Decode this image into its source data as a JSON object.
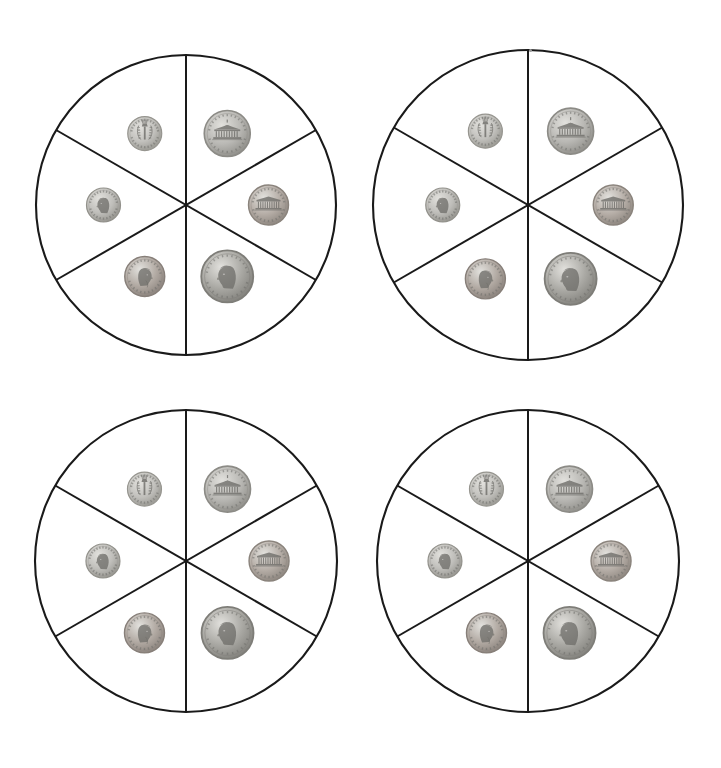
{
  "page": {
    "background_color": "#ffffff",
    "width": 721,
    "height": 768,
    "line_color": "#1a1a1a",
    "sector_count": 6
  },
  "coin_types": {
    "nickel_reverse": {
      "name": "nickel-reverse-monticello",
      "label": "Nickel (Monticello reverse)",
      "value_cents": 5,
      "diameter_px": 46,
      "metal_color": "#b9b8b4",
      "rim_color": "#8c8b86",
      "top_text": "UNITED STATES",
      "center_motif": "monticello-building",
      "mid_text": "MONTICELLO",
      "bottom_text": "FIVE CENTS"
    },
    "dime_reverse": {
      "name": "dime-reverse-torch",
      "label": "Dime (torch reverse)",
      "value_cents": 10,
      "diameter_px": 34,
      "metal_color": "#c2c1bd",
      "rim_color": "#96958f",
      "top_text": "UNITED STATES",
      "center_motif": "torch-olive-oak",
      "bottom_text": "ONE DIME"
    },
    "dime_obverse": {
      "name": "dime-obverse-roosevelt",
      "label": "Dime (Roosevelt obverse)",
      "value_cents": 10,
      "diameter_px": 34,
      "metal_color": "#bfbeba",
      "rim_color": "#92918b",
      "left_text": "LIBERTY",
      "center_motif": "roosevelt-profile",
      "bottom_text": "IN GOD WE TRUST"
    },
    "penny_reverse": {
      "name": "penny-reverse-lincoln-memorial",
      "label": "Penny (Lincoln Memorial reverse)",
      "value_cents": 1,
      "diameter_px": 40,
      "metal_color": "#b5ada6",
      "rim_color": "#8a837c",
      "top_text": "UNITED STATES",
      "center_motif": "lincoln-memorial",
      "bottom_text": "ONE CENT"
    },
    "penny_obverse": {
      "name": "penny-obverse-lincoln",
      "label": "Penny (Lincoln obverse)",
      "value_cents": 1,
      "diameter_px": 40,
      "metal_color": "#b2aaa3",
      "rim_color": "#877f79",
      "left_text": "LIBERTY",
      "center_motif": "lincoln-profile",
      "bottom_text": "IN GOD WE TRUST"
    },
    "nickel_obverse": {
      "name": "nickel-obverse-jefferson",
      "label": "Nickel (Jefferson obverse)",
      "value_cents": 5,
      "diameter_px": 52,
      "metal_color": "#a9a8a3",
      "rim_color": "#7e7d78",
      "left_text": "LIBERTY",
      "center_motif": "jefferson-profile",
      "bottom_text": "IN GOD WE TRUST"
    }
  },
  "spinners": [
    {
      "id": "spinner-1",
      "position_label": "top-left",
      "cx": 186,
      "cy": 205,
      "r": 150,
      "sectors": [
        {
          "index": 0,
          "angle_deg": -60,
          "coin": "nickel_reverse"
        },
        {
          "index": 1,
          "angle_deg": -120,
          "coin": "dime_reverse"
        },
        {
          "index": 2,
          "angle_deg": 180,
          "coin": "dime_obverse"
        },
        {
          "index": 3,
          "angle_deg": 0,
          "coin": "penny_reverse"
        },
        {
          "index": 4,
          "angle_deg": 120,
          "coin": "penny_obverse"
        },
        {
          "index": 5,
          "angle_deg": 60,
          "coin": "nickel_obverse"
        }
      ]
    },
    {
      "id": "spinner-2",
      "position_label": "top-right",
      "cx": 528,
      "cy": 205,
      "r": 155,
      "sectors": [
        {
          "index": 0,
          "angle_deg": -60,
          "coin": "nickel_reverse"
        },
        {
          "index": 1,
          "angle_deg": -120,
          "coin": "dime_reverse"
        },
        {
          "index": 2,
          "angle_deg": 180,
          "coin": "dime_obverse"
        },
        {
          "index": 3,
          "angle_deg": 0,
          "coin": "penny_reverse"
        },
        {
          "index": 4,
          "angle_deg": 120,
          "coin": "penny_obverse"
        },
        {
          "index": 5,
          "angle_deg": 60,
          "coin": "nickel_obverse"
        }
      ]
    },
    {
      "id": "spinner-3",
      "position_label": "bottom-left",
      "cx": 186,
      "cy": 561,
      "r": 151,
      "sectors": [
        {
          "index": 0,
          "angle_deg": -60,
          "coin": "nickel_reverse"
        },
        {
          "index": 1,
          "angle_deg": -120,
          "coin": "dime_reverse"
        },
        {
          "index": 2,
          "angle_deg": 180,
          "coin": "dime_obverse"
        },
        {
          "index": 3,
          "angle_deg": 0,
          "coin": "penny_reverse"
        },
        {
          "index": 4,
          "angle_deg": 120,
          "coin": "penny_obverse"
        },
        {
          "index": 5,
          "angle_deg": 60,
          "coin": "nickel_obverse"
        }
      ]
    },
    {
      "id": "spinner-4",
      "position_label": "bottom-right",
      "cx": 528,
      "cy": 561,
      "r": 151,
      "sectors": [
        {
          "index": 0,
          "angle_deg": -60,
          "coin": "nickel_reverse"
        },
        {
          "index": 1,
          "angle_deg": -120,
          "coin": "dime_reverse"
        },
        {
          "index": 2,
          "angle_deg": 180,
          "coin": "dime_obverse"
        },
        {
          "index": 3,
          "angle_deg": 0,
          "coin": "penny_reverse"
        },
        {
          "index": 4,
          "angle_deg": 120,
          "coin": "penny_obverse"
        },
        {
          "index": 5,
          "angle_deg": 60,
          "coin": "nickel_obverse"
        }
      ]
    }
  ],
  "artifacts": [
    {
      "name": "scan-speck",
      "x": 529,
      "y": 49
    }
  ]
}
